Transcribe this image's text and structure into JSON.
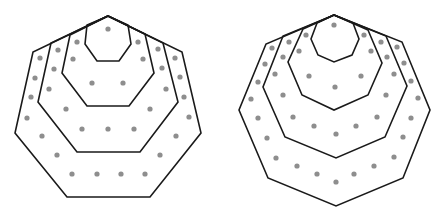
{
  "diagram": {
    "colors": {
      "stroke": "#1a1a1a",
      "dot": "#8e8e8e",
      "background": "#ffffff"
    },
    "figures": [
      {
        "name": "heptagonal-numbers",
        "sides": 7,
        "counts": [
          1,
          7,
          18,
          34
        ],
        "polygons": [
          "108,16 128,25 131,44 119,61 97,61 85,44 87,25",
          "108,16 145,34 154,73 129,106 87,106 62,73 70,35",
          "108,16 163,43 178,102 140,152 77,152 38,102 51,43",
          "108,16 182,52 201,133 150,197 67,197 15,133 33,52"
        ],
        "dots": [
          [
            108,
            29
          ],
          [
            77,
            42
          ],
          [
            138,
            42
          ],
          [
            73,
            59
          ],
          [
            143,
            59
          ],
          [
            92,
            83
          ],
          [
            123,
            83
          ],
          [
            58,
            50
          ],
          [
            158,
            49
          ],
          [
            54,
            69
          ],
          [
            162,
            68
          ],
          [
            49,
            89
          ],
          [
            166,
            89
          ],
          [
            66,
            109
          ],
          [
            150,
            109
          ],
          [
            82,
            129
          ],
          [
            108,
            129
          ],
          [
            134,
            129
          ],
          [
            40,
            58
          ],
          [
            175,
            58
          ],
          [
            35,
            78
          ],
          [
            180,
            77
          ],
          [
            31,
            97
          ],
          [
            184,
            97
          ],
          [
            27,
            118
          ],
          [
            189,
            117
          ],
          [
            42,
            136
          ],
          [
            176,
            136
          ],
          [
            57,
            155
          ],
          [
            160,
            155
          ],
          [
            72,
            174
          ],
          [
            97,
            174
          ],
          [
            121,
            174
          ],
          [
            145,
            174
          ]
        ]
      },
      {
        "name": "octagonal-numbers",
        "sides": 8,
        "counts": [
          1,
          8,
          21,
          40
        ],
        "polygons": [
          "334,15 353,23 359,39 352,55 334,62 318,55 311,39 317,23",
          "334,15 368,30 382,63 368,95 334,110 302,95 288,62 303,29",
          "334,15 386,36 407,86 385,137 336,158 285,137 263,87 283,36",
          "334,15 402,42 430,110 403,178 336,206 268,178 239,110 266,44"
        ],
        "dots": [
          [
            334,
            25
          ],
          [
            306,
            35
          ],
          [
            364,
            35
          ],
          [
            299,
            51
          ],
          [
            371,
            51
          ],
          [
            309,
            76
          ],
          [
            361,
            76
          ],
          [
            335,
            87
          ],
          [
            289,
            42
          ],
          [
            381,
            42
          ],
          [
            283,
            57
          ],
          [
            387,
            57
          ],
          [
            275,
            74
          ],
          [
            394,
            74
          ],
          [
            283,
            95
          ],
          [
            386,
            95
          ],
          [
            293,
            117
          ],
          [
            377,
            117
          ],
          [
            314,
            126
          ],
          [
            356,
            126
          ],
          [
            336,
            134
          ],
          [
            272,
            48
          ],
          [
            397,
            47
          ],
          [
            265,
            64
          ],
          [
            404,
            63
          ],
          [
            258,
            82
          ],
          [
            411,
            81
          ],
          [
            251,
            99
          ],
          [
            418,
            98
          ],
          [
            258,
            118
          ],
          [
            411,
            118
          ],
          [
            267,
            138
          ],
          [
            403,
            137
          ],
          [
            276,
            158
          ],
          [
            394,
            157
          ],
          [
            297,
            166
          ],
          [
            374,
            166
          ],
          [
            317,
            174
          ],
          [
            354,
            174
          ],
          [
            336,
            182
          ]
        ]
      }
    ]
  }
}
